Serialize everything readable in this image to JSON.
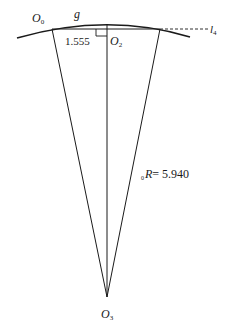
{
  "diagram": {
    "points": {
      "O0": {
        "name": "O",
        "sub": "0"
      },
      "O2": {
        "name": "O",
        "sub": "2"
      },
      "O3": {
        "name": "O",
        "sub": "3"
      }
    },
    "arc_label": "g",
    "line_label": {
      "name": "l",
      "sub": "4"
    },
    "dimension_label": "1.555",
    "radius_label": {
      "prefix": "0",
      "name": "R",
      "value": "= 5.940"
    },
    "colors": {
      "stroke": "#1a1a1a",
      "background": "#ffffff"
    }
  }
}
